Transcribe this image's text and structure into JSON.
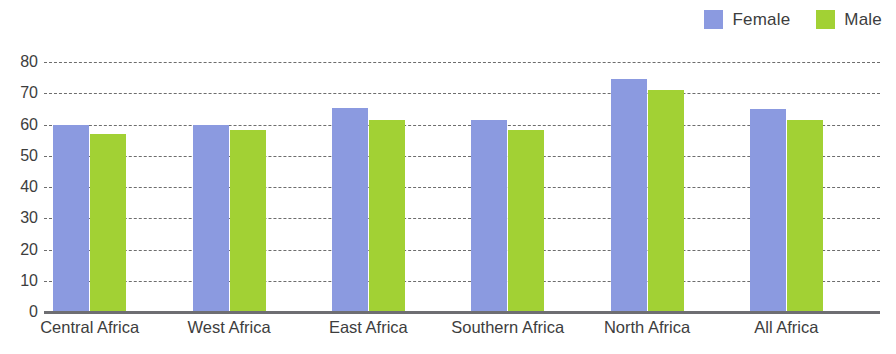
{
  "chart_data": {
    "type": "bar",
    "title": "",
    "subtitle": "",
    "xlabel": "",
    "ylabel": "",
    "categories": [
      "Central Africa",
      "West Africa",
      "East Africa",
      "Southern Africa",
      "North Africa",
      "All Africa"
    ],
    "series": [
      {
        "name": "Female",
        "color": "#8b9ae0",
        "values": [
          60.0,
          60.0,
          65.2,
          61.5,
          74.6,
          65.0
        ]
      },
      {
        "name": "Male",
        "color": "#a2d134",
        "values": [
          57.0,
          58.2,
          61.5,
          58.4,
          71.0,
          61.5
        ]
      }
    ],
    "ylim": [
      0,
      80
    ],
    "yticks": [
      0,
      10,
      20,
      30,
      40,
      50,
      60,
      70,
      80
    ],
    "ytick_labels": [
      "0",
      "10",
      "20",
      "30",
      "40",
      "50",
      "60",
      "70",
      "80"
    ],
    "grid": true,
    "grid_style": "dotted-horizontal",
    "legend_position": "top-right",
    "bar_group_count": 6,
    "bars_per_group": 2
  },
  "legend": {
    "entries": [
      {
        "label": "Female",
        "color": "#8b9ae0",
        "swatch_name": "legend-swatch-female"
      },
      {
        "label": "Male",
        "color": "#a2d134",
        "swatch_name": "legend-swatch-male"
      }
    ]
  },
  "colors": {
    "female": "#8b9ae0",
    "male": "#a2d134",
    "axis": "#6e6e72",
    "grid": "#6d6d6d",
    "text": "#3d3d3d",
    "background": "#ffffff"
  }
}
